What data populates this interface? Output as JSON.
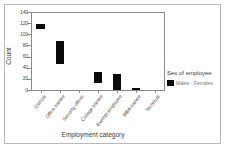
{
  "chart_data": {
    "type": "bar",
    "title": "",
    "xlabel": "Employment category",
    "ylabel": "Count",
    "ylim": [
      0,
      140
    ],
    "yticks": [
      0,
      20,
      40,
      60,
      80,
      100,
      120,
      140
    ],
    "ytick_labels": [
      "0",
      "20",
      "40",
      "60",
      "80",
      "100",
      "120",
      "140"
    ],
    "grid": false,
    "legend_position": "right",
    "legend_title": "Sex of employee",
    "legend_entries": [
      {
        "label": "Males - Females",
        "color": "#0a0a0a"
      }
    ],
    "categories": [
      "Clerical",
      "Office trainee",
      "Security officer",
      "College trainee",
      "Exempt employee",
      "MBA trainee",
      "Technical"
    ],
    "series": [
      {
        "name": "Males - Females",
        "type": "range",
        "low": [
          110,
          46,
          0,
          13,
          0,
          0,
          0
        ],
        "high": [
          118,
          88,
          0,
          32,
          29,
          3,
          0
        ],
        "values": [
          8,
          42,
          0,
          19,
          29,
          3,
          0
        ]
      }
    ],
    "bars": [
      {
        "category": "Clerical",
        "low": 110,
        "high": 118
      },
      {
        "category": "Office trainee",
        "low": 46,
        "high": 88
      },
      {
        "category": "Security officer",
        "low": 0,
        "high": 0
      },
      {
        "category": "College trainee",
        "low": 13,
        "high": 32
      },
      {
        "category": "Exempt employee",
        "low": 0,
        "high": 29
      },
      {
        "category": "MBA trainee",
        "low": 0,
        "high": 3
      },
      {
        "category": "Technical",
        "low": 0,
        "high": 0
      }
    ],
    "colors": {
      "bar": "#0a0a0a",
      "axis": "#8a8a8a",
      "frame": "#b9b9b9",
      "text": "#3a3a3a",
      "tick_text": "#4a4a4a",
      "legend_text": "#777777",
      "background": "#ffffff"
    }
  }
}
